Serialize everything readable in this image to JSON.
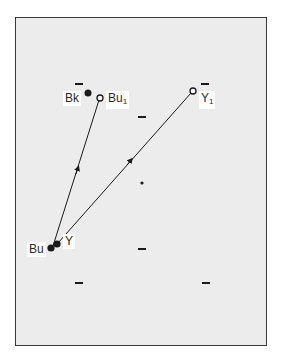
{
  "diagram": {
    "type": "color-space vector diagram",
    "points": [
      {
        "id": "Bu",
        "label": "Bu",
        "fill": "filled",
        "x": 51,
        "y": 248
      },
      {
        "id": "Y",
        "label": "Y",
        "fill": "filled",
        "x": 57,
        "y": 244
      },
      {
        "id": "Bk",
        "label": "Bk",
        "fill": "filled",
        "x": 88,
        "y": 93
      },
      {
        "id": "Bu1",
        "label": "Bu",
        "sub": "1",
        "fill": "open",
        "x": 100,
        "y": 98
      },
      {
        "id": "Y1",
        "label": "Y",
        "sub": "1",
        "fill": "open",
        "x": 193,
        "y": 91
      }
    ],
    "arrows": [
      {
        "from": "Bu",
        "to": "Bu1"
      },
      {
        "from": "Y",
        "to": "Y1"
      }
    ],
    "center_dot": {
      "x": 142,
      "y": 183
    },
    "ticks": [
      {
        "x": 79,
        "y": 84
      },
      {
        "x": 205,
        "y": 84
      },
      {
        "x": 142,
        "y": 117
      },
      {
        "x": 142,
        "y": 249
      },
      {
        "x": 79,
        "y": 283
      },
      {
        "x": 206,
        "y": 283
      }
    ]
  },
  "labels": {
    "bk": "Bk",
    "bu1": "Bu",
    "bu1_sub": "1",
    "y1": "Y",
    "y1_sub": "1",
    "bu": "Bu",
    "y": "Y"
  }
}
